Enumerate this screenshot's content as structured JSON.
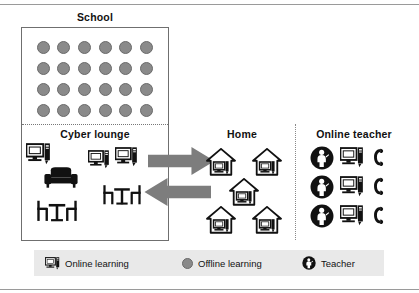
{
  "figure": {
    "width": 419,
    "height": 293,
    "background": "#ffffff"
  },
  "colors": {
    "offline_dot": "#8a8a8a",
    "teacher_badge": "#111111",
    "arrow_fill": "#7d7d7d",
    "legend_background": "#e9e9e9",
    "frame_line": "#6f6f6f"
  },
  "school": {
    "title": "School",
    "student_dot_count": 24,
    "student_dot_rows": 4,
    "student_dot_cols": 6,
    "dot_icon_name": "offline-learning-dot"
  },
  "cyber_lounge": {
    "title": "Cyber lounge",
    "computers": [
      {
        "icon": "computer-icon",
        "label": "computer-1"
      },
      {
        "icon": "computer-icon",
        "label": "computer-2"
      },
      {
        "icon": "computer-icon",
        "label": "computer-3"
      }
    ],
    "furniture": [
      {
        "icon": "sofa-icon",
        "label": "sofa"
      },
      {
        "icon": "table-chairs-icon",
        "label": "table-chairs-1"
      },
      {
        "icon": "table-chairs-icon",
        "label": "table-chairs-2"
      }
    ]
  },
  "arrows": [
    {
      "name": "arrow-school-to-home",
      "direction": "right"
    },
    {
      "name": "arrow-home-to-school",
      "direction": "left"
    }
  ],
  "home": {
    "title": "Home",
    "house_count": 5,
    "house_icon": "house-with-computer-icon"
  },
  "online_teacher": {
    "title": "Online teacher",
    "rows": [
      {
        "teacher": "teacher-badge-icon",
        "computer": "computer-icon",
        "phone": "phone-icon"
      },
      {
        "teacher": "teacher-badge-icon",
        "computer": "computer-icon",
        "phone": "phone-icon"
      },
      {
        "teacher": "teacher-badge-icon",
        "computer": "computer-icon",
        "phone": "phone-icon"
      }
    ]
  },
  "legend": {
    "items": [
      {
        "icon": "computer-icon",
        "label": "Online learning"
      },
      {
        "icon": "offline-learning-dot",
        "label": "Offline learning"
      },
      {
        "icon": "teacher-badge-icon",
        "label": "Teacher"
      }
    ]
  }
}
